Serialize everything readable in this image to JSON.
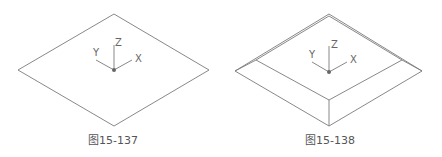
{
  "figures": [
    {
      "id": "fig-15-137",
      "caption": "图15-137",
      "axes": {
        "x": "X",
        "y": "Y",
        "z": "Z"
      }
    },
    {
      "id": "fig-15-138",
      "caption": "图15-138",
      "axes": {
        "x": "X",
        "y": "Y",
        "z": "Z"
      }
    }
  ],
  "colors": {
    "line": "#777777",
    "text": "#555555"
  }
}
